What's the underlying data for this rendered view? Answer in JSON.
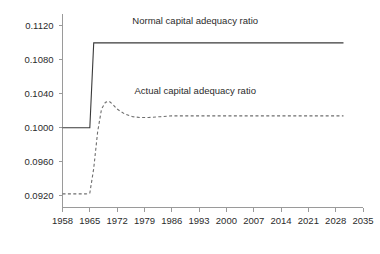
{
  "chart_data": {
    "type": "line",
    "title": "",
    "subtitle": "",
    "xlabel": "",
    "ylabel": "",
    "xlim": [
      1958,
      2035
    ],
    "ylim": [
      0.0906,
      0.1134
    ],
    "grid": false,
    "legend_position": "inline-annotation",
    "x_ticks": [
      "1958",
      "1965",
      "1972",
      "1979",
      "1986",
      "1993",
      "2000",
      "2007",
      "2014",
      "2021",
      "2028",
      "2035"
    ],
    "y_ticks": [
      "0.0920",
      "0.0960",
      "0.1000",
      "0.1040",
      "0.1080",
      "0.1120"
    ],
    "x_tick_values": [
      1958,
      1965,
      1972,
      1979,
      1986,
      1993,
      2000,
      2007,
      2014,
      2021,
      2028,
      2035
    ],
    "y_tick_values": [
      0.092,
      0.096,
      0.1,
      0.104,
      0.108,
      0.112
    ],
    "series": [
      {
        "name": "Normal capital adequacy ratio",
        "style": "solid",
        "color": "#3a3a3a",
        "annotation": "Normal capital adequacy ratio",
        "x": [
          1958,
          1962,
          1964,
          1965,
          1966,
          1970,
          1980,
          1990,
          2000,
          2010,
          2020,
          2030
        ],
        "values": [
          0.1,
          0.1,
          0.1,
          0.1,
          0.11,
          0.11,
          0.11,
          0.11,
          0.11,
          0.11,
          0.11,
          0.11
        ]
      },
      {
        "name": "Actual capital adequacy ratio",
        "style": "dashed",
        "color": "#6e6e6e",
        "annotation": "Actual capital adequacy ratio",
        "x": [
          1958,
          1960,
          1962,
          1964,
          1965,
          1966,
          1967,
          1968,
          1969,
          1970,
          1971,
          1972,
          1974,
          1976,
          1978,
          1980,
          1983,
          1986,
          1990,
          1995,
          2000,
          2005,
          2010,
          2015,
          2020,
          2025,
          2030
        ],
        "values": [
          0.0922,
          0.0922,
          0.0922,
          0.0922,
          0.0923,
          0.0952,
          0.0995,
          0.1022,
          0.103,
          0.1031,
          0.1027,
          0.1022,
          0.1016,
          0.1013,
          0.1012,
          0.1012,
          0.1013,
          0.1014,
          0.1014,
          0.1014,
          0.1014,
          0.1014,
          0.1014,
          0.1014,
          0.1014,
          0.1014,
          0.1014
        ]
      }
    ],
    "annotations": [
      {
        "text": "Normal capital adequacy ratio",
        "x": 1992,
        "y": 0.1122
      },
      {
        "text": "Actual capital adequacy ratio",
        "x": 1992,
        "y": 0.104
      }
    ]
  },
  "axis": {
    "y_label_0": "0.1120",
    "y_label_1": "0.1080",
    "y_label_2": "0.1040",
    "y_label_3": "0.1000",
    "y_label_4": "0.0960",
    "y_label_5": "0.0920"
  },
  "colors": {
    "axis": "#9a9a9a",
    "text": "#2b2b2b",
    "normal_series": "#3a3a3a",
    "actual_series": "#6e6e6e",
    "background": "#ffffff"
  }
}
